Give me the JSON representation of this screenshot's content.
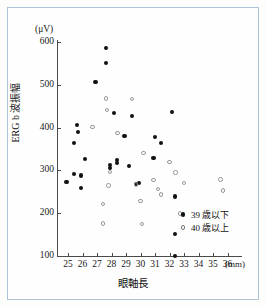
{
  "chart_data": {
    "type": "scatter",
    "title": "",
    "xlabel": "眼軸長",
    "ylabel": "ERG b 波振幅",
    "x_unit": "(mm)",
    "y_unit": "(μV)",
    "xlim": [
      24.4,
      36.6
    ],
    "ylim": [
      60,
      620
    ],
    "xticks": [
      25,
      26,
      27,
      28,
      29,
      30,
      31,
      32,
      33,
      34,
      35,
      36
    ],
    "yticks": [
      100,
      200,
      300,
      400,
      500,
      600
    ],
    "grid": false,
    "legend_position": "bottom-right",
    "series": [
      {
        "name": "39 歳以下",
        "marker": "filled-circle",
        "color": "#111111",
        "points": [
          [
            24.9,
            272
          ],
          [
            25.4,
            365
          ],
          [
            25.4,
            292
          ],
          [
            25.6,
            406
          ],
          [
            25.7,
            390
          ],
          [
            25.9,
            288
          ],
          [
            25.9,
            258
          ],
          [
            26.2,
            326
          ],
          [
            26.9,
            506
          ],
          [
            27.6,
            587
          ],
          [
            27.6,
            551
          ],
          [
            27.9,
            312
          ],
          [
            27.9,
            305
          ],
          [
            28.2,
            434
          ],
          [
            28.4,
            325
          ],
          [
            28.4,
            318
          ],
          [
            28.9,
            381
          ],
          [
            29.2,
            311
          ],
          [
            29.4,
            427
          ],
          [
            29.7,
            269
          ],
          [
            29.9,
            271
          ],
          [
            30.9,
            329
          ],
          [
            31.0,
            377
          ],
          [
            31.4,
            365
          ],
          [
            32.2,
            437
          ],
          [
            32.4,
            239
          ],
          [
            32.4,
            151
          ],
          [
            32.4,
            100
          ]
        ]
      },
      {
        "name": "40 歳以上",
        "marker": "open-circle",
        "color": "#9a9a9a",
        "points": [
          [
            26.7,
            402
          ],
          [
            27.4,
            221
          ],
          [
            27.4,
            176
          ],
          [
            27.6,
            468
          ],
          [
            27.7,
            441
          ],
          [
            27.8,
            265
          ],
          [
            27.9,
            297
          ],
          [
            28.4,
            388
          ],
          [
            29.4,
            467
          ],
          [
            29.7,
            267
          ],
          [
            30.0,
            228
          ],
          [
            30.1,
            175
          ],
          [
            30.2,
            341
          ],
          [
            30.9,
            277
          ],
          [
            31.2,
            256
          ],
          [
            31.4,
            244
          ],
          [
            32.0,
            320
          ],
          [
            32.4,
            295
          ],
          [
            32.7,
            199
          ],
          [
            33.0,
            270
          ],
          [
            35.5,
            279
          ],
          [
            35.7,
            253
          ]
        ]
      }
    ]
  },
  "legend": {
    "items": [
      {
        "label": "39 歳以下",
        "marker": "filled-circle"
      },
      {
        "label": "40 歳以上",
        "marker": "open-circle"
      }
    ]
  },
  "axes": {
    "y_unit_label": "(μV)",
    "x_unit_label": "(mm)",
    "y_title": "ERG b 波振幅",
    "x_title": "眼軸長"
  }
}
